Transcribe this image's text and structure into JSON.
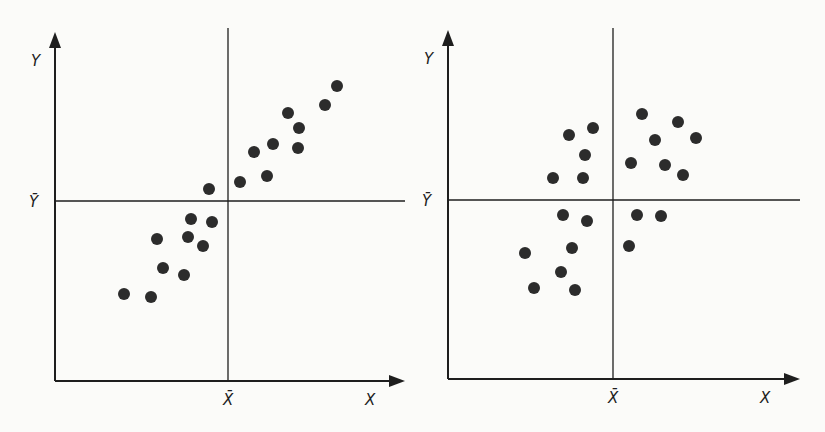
{
  "figure": {
    "background": "#fbfbf9",
    "ink": "#1e1e1e",
    "dot_color": "#2c2c2c",
    "dot_radius": 6
  },
  "chart_data": [
    {
      "type": "scatter",
      "title": "",
      "panel": "left",
      "xlabel": "X",
      "ylabel": "Y",
      "x_mean_label": "X̄",
      "y_mean_label": "Ȳ",
      "grid": false,
      "description": "Positive linear association; most points in lower-left and upper-right quadrants",
      "axes_px": {
        "origin": [
          55,
          381
        ],
        "y_top": 32,
        "x_right": 405,
        "x_mean": 228,
        "y_mean": 201
      },
      "points": [
        [
          337,
          86
        ],
        [
          325,
          105
        ],
        [
          288,
          113
        ],
        [
          299,
          128
        ],
        [
          273,
          144
        ],
        [
          298,
          148
        ],
        [
          254,
          152
        ],
        [
          267,
          176
        ],
        [
          240,
          182
        ],
        [
          209,
          189
        ],
        [
          191,
          219
        ],
        [
          212,
          222
        ],
        [
          157,
          239
        ],
        [
          188,
          237
        ],
        [
          203,
          246
        ],
        [
          163,
          268
        ],
        [
          184,
          275
        ],
        [
          124,
          294
        ],
        [
          151,
          297
        ]
      ]
    },
    {
      "type": "scatter",
      "title": "",
      "panel": "right",
      "xlabel": "X",
      "ylabel": "Y",
      "x_mean_label": "X̄",
      "y_mean_label": "Ȳ",
      "grid": false,
      "description": "No linear association; points spread across all four quadrants",
      "axes_px": {
        "origin": [
          448,
          379
        ],
        "y_top": 30,
        "x_right": 800,
        "x_mean": 613,
        "y_mean": 200
      },
      "points": [
        [
          642,
          114
        ],
        [
          678,
          122
        ],
        [
          593,
          128
        ],
        [
          569,
          135
        ],
        [
          655,
          140
        ],
        [
          696,
          138
        ],
        [
          585,
          155
        ],
        [
          631,
          163
        ],
        [
          665,
          165
        ],
        [
          683,
          175
        ],
        [
          553,
          178
        ],
        [
          583,
          178
        ],
        [
          563,
          215
        ],
        [
          587,
          221
        ],
        [
          637,
          215
        ],
        [
          661,
          216
        ],
        [
          572,
          248
        ],
        [
          629,
          246
        ],
        [
          525,
          253
        ],
        [
          561,
          272
        ],
        [
          534,
          288
        ],
        [
          575,
          290
        ]
      ]
    }
  ]
}
